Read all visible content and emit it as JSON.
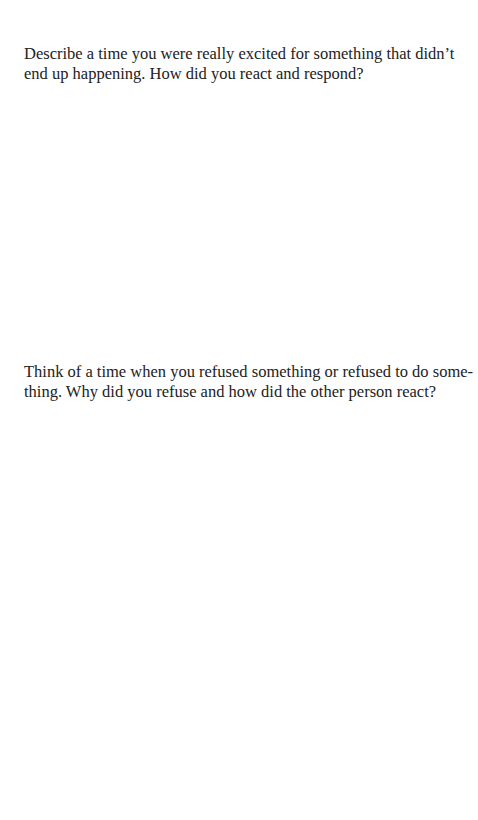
{
  "prompts": [
    {
      "text": "Describe a time you were really excited for something that didn’t end up happening. How did you react and respond?"
    },
    {
      "text": "Think of a time when you refused something or refused to do some­thing. Why did you refuse and how did the other person react?"
    }
  ]
}
